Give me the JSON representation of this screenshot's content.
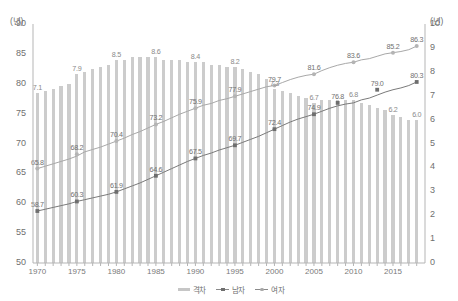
{
  "axes": {
    "left_unit": "(년)",
    "right_unit": "(년)",
    "left_ticks": [
      "90",
      "85",
      "80",
      "75",
      "70",
      "65",
      "60",
      "55",
      "50"
    ],
    "right_ticks": [
      "10",
      "9",
      "8",
      "7",
      "6",
      "5",
      "4",
      "3",
      "2",
      "1",
      "0"
    ],
    "x_ticks": [
      "1970",
      "1975",
      "1980",
      "1985",
      "1990",
      "1995",
      "2000",
      "2005",
      "2010",
      "2015"
    ]
  },
  "legend": {
    "items": [
      {
        "label": "격차",
        "type": "bar",
        "color": "#c6c6c6"
      },
      {
        "label": "남자",
        "type": "line-square",
        "color": "#6e6e6e"
      },
      {
        "label": "여자",
        "type": "line-circle",
        "color": "#a9a9a9"
      }
    ]
  },
  "chart_data": {
    "type": "bar",
    "title": "",
    "xlabel": "",
    "ylabel": "(년)",
    "ylim": [
      50,
      90
    ],
    "y2lim": [
      0,
      10
    ],
    "grid": false,
    "legend_position": "bottom",
    "x": [
      1970,
      1971,
      1972,
      1973,
      1974,
      1975,
      1976,
      1977,
      1978,
      1979,
      1980,
      1981,
      1982,
      1983,
      1984,
      1985,
      1986,
      1987,
      1988,
      1989,
      1990,
      1991,
      1992,
      1993,
      1994,
      1995,
      1996,
      1997,
      1998,
      1999,
      2000,
      2001,
      2002,
      2003,
      2004,
      2005,
      2006,
      2007,
      2008,
      2009,
      2010,
      2011,
      2012,
      2013,
      2014,
      2015,
      2016,
      2017,
      2018
    ],
    "series": [
      {
        "name": "격차",
        "axis": "right",
        "type": "bar",
        "values": [
          7.1,
          7.2,
          7.3,
          7.4,
          7.5,
          7.9,
          8.0,
          8.1,
          8.2,
          8.3,
          8.5,
          8.5,
          8.6,
          8.6,
          8.6,
          8.6,
          8.5,
          8.5,
          8.5,
          8.4,
          8.4,
          8.4,
          8.3,
          8.3,
          8.2,
          8.2,
          8.1,
          8.0,
          7.9,
          7.7,
          7.3,
          7.2,
          7.1,
          7.0,
          6.9,
          6.7,
          6.8,
          6.8,
          6.8,
          6.8,
          6.8,
          6.7,
          6.6,
          6.5,
          6.4,
          6.2,
          6.1,
          6.0,
          6.0
        ],
        "labeled_points": [
          {
            "x": 1970,
            "value": 7.1
          },
          {
            "x": 1975,
            "value": 7.9
          },
          {
            "x": 1980,
            "value": 8.5
          },
          {
            "x": 1985,
            "value": 8.6
          },
          {
            "x": 1990,
            "value": 8.4
          },
          {
            "x": 1995,
            "value": 8.2
          },
          {
            "x": 2000,
            "value": 7.3
          },
          {
            "x": 2005,
            "value": 6.7
          },
          {
            "x": 2010,
            "value": 6.8
          },
          {
            "x": 2015,
            "value": 6.2
          },
          {
            "x": 2018,
            "value": 6.0
          }
        ]
      },
      {
        "name": "남자",
        "axis": "left",
        "type": "line",
        "values": [
          58.7,
          59.0,
          59.3,
          59.6,
          59.9,
          60.3,
          60.6,
          60.9,
          61.2,
          61.5,
          61.9,
          62.4,
          62.9,
          63.4,
          64.0,
          64.6,
          65.2,
          65.8,
          66.4,
          67.0,
          67.5,
          68.0,
          68.4,
          68.9,
          69.3,
          69.7,
          70.2,
          70.7,
          71.2,
          71.8,
          72.4,
          73.0,
          73.6,
          74.1,
          74.5,
          74.9,
          75.4,
          75.9,
          76.3,
          76.6,
          76.8,
          77.3,
          77.6,
          78.1,
          78.6,
          79.0,
          79.3,
          79.7,
          80.3
        ],
        "labeled_points": [
          {
            "x": 1970,
            "value": 58.7
          },
          {
            "x": 1975,
            "value": 60.3
          },
          {
            "x": 1980,
            "value": 61.9
          },
          {
            "x": 1985,
            "value": 64.6
          },
          {
            "x": 1990,
            "value": 67.5
          },
          {
            "x": 1995,
            "value": 69.7
          },
          {
            "x": 2000,
            "value": 72.4
          },
          {
            "x": 2005,
            "value": 74.9
          },
          {
            "x": 2008,
            "value": 76.8
          },
          {
            "x": 2013,
            "value": 79.0
          },
          {
            "x": 2018,
            "value": 80.3
          }
        ]
      },
      {
        "name": "여자",
        "axis": "left",
        "type": "line",
        "values": [
          65.8,
          66.2,
          66.6,
          67.0,
          67.4,
          67.9,
          68.6,
          69.0,
          69.4,
          69.9,
          70.4,
          70.9,
          71.5,
          72.0,
          72.6,
          73.2,
          73.7,
          74.3,
          74.9,
          75.4,
          75.9,
          76.4,
          76.7,
          77.2,
          77.5,
          77.9,
          78.3,
          78.7,
          79.1,
          79.5,
          79.7,
          80.2,
          80.7,
          81.1,
          81.4,
          81.6,
          82.2,
          82.7,
          83.1,
          83.4,
          83.6,
          84.0,
          84.2,
          84.6,
          85.0,
          85.2,
          85.4,
          85.7,
          86.3
        ],
        "labeled_points": [
          {
            "x": 1970,
            "value": 65.8
          },
          {
            "x": 1975,
            "value": 68.2
          },
          {
            "x": 1980,
            "value": 70.4
          },
          {
            "x": 1985,
            "value": 73.2
          },
          {
            "x": 1990,
            "value": 75.9
          },
          {
            "x": 1995,
            "value": 77.9
          },
          {
            "x": 2000,
            "value": 79.7
          },
          {
            "x": 2005,
            "value": 81.6
          },
          {
            "x": 2010,
            "value": 83.6
          },
          {
            "x": 2015,
            "value": 85.2
          },
          {
            "x": 2018,
            "value": 86.3
          }
        ]
      }
    ]
  }
}
